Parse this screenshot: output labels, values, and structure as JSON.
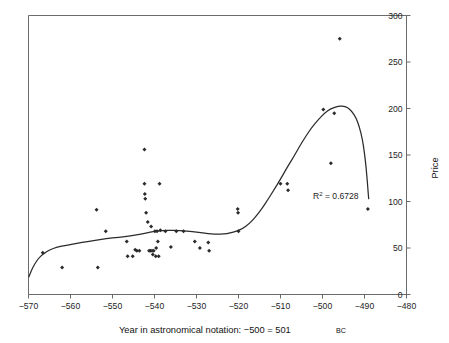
{
  "chart_data": {
    "type": "scatter",
    "title": "",
    "subtitle": "",
    "xlabel_main": "Year in astronomical notation: −500 = 501",
    "xlabel_era": "BC",
    "ylabel": "Price",
    "xlim": [
      -570,
      -480
    ],
    "ylim": [
      0,
      300
    ],
    "grid": false,
    "legend": "none",
    "xticks": [
      -570,
      -560,
      -550,
      -540,
      -530,
      -520,
      -510,
      -500,
      -490,
      -480
    ],
    "xtick_labels": [
      "−570",
      "−560",
      "−550",
      "−540",
      "−530",
      "−520",
      "−510",
      "−500",
      "−490",
      "−480"
    ],
    "yticks": [
      0,
      50,
      100,
      150,
      200,
      250,
      300
    ],
    "ytick_labels": [
      "0",
      "50",
      "100",
      "150",
      "200",
      "250",
      "300"
    ],
    "y_axis_position": "right",
    "annotations": [
      {
        "name": "r-squared",
        "text_prefix": "R",
        "text_sup": "2",
        "text_suffix": " = 0.6728",
        "x": -499.5,
        "y": 106
      }
    ],
    "series": [
      {
        "name": "Price observations",
        "marker": "diamond",
        "color": "#2a2a2a",
        "points": [
          [
            -566.6,
            45
          ],
          [
            -562.0,
            29
          ],
          [
            -553.8,
            91
          ],
          [
            -553.5,
            29
          ],
          [
            -551.6,
            68
          ],
          [
            -546.6,
            57
          ],
          [
            -546.4,
            41
          ],
          [
            -545.2,
            41
          ],
          [
            -544.6,
            48
          ],
          [
            -544.2,
            47
          ],
          [
            -543.6,
            47
          ],
          [
            -542.4,
            119
          ],
          [
            -542.4,
            156
          ],
          [
            -542.3,
            108
          ],
          [
            -542.2,
            103
          ],
          [
            -542.0,
            88
          ],
          [
            -541.6,
            78
          ],
          [
            -541.3,
            47
          ],
          [
            -541.0,
            47
          ],
          [
            -540.8,
            73
          ],
          [
            -540.6,
            47
          ],
          [
            -540.4,
            43
          ],
          [
            -540.2,
            47
          ],
          [
            -539.9,
            68
          ],
          [
            -539.7,
            41
          ],
          [
            -539.6,
            50
          ],
          [
            -539.4,
            68
          ],
          [
            -539.2,
            57
          ],
          [
            -539.0,
            41
          ],
          [
            -538.8,
            119
          ],
          [
            -538.6,
            69
          ],
          [
            -537.4,
            68
          ],
          [
            -536.1,
            51
          ],
          [
            -534.8,
            68
          ],
          [
            -533.1,
            68
          ],
          [
            -530.4,
            57
          ],
          [
            -529.2,
            50
          ],
          [
            -527.2,
            56
          ],
          [
            -527.0,
            47
          ],
          [
            -520.2,
            92
          ],
          [
            -520.1,
            88
          ],
          [
            -520.0,
            68
          ],
          [
            -510.0,
            119
          ],
          [
            -508.4,
            119
          ],
          [
            -508.2,
            112
          ],
          [
            -499.8,
            199
          ],
          [
            -498.0,
            141
          ],
          [
            -497.2,
            195
          ],
          [
            -495.9,
            275
          ],
          [
            -489.2,
            92
          ]
        ]
      }
    ],
    "trend": {
      "name": "polynomial-fit",
      "color": "#2b2b2b",
      "r_squared": 0.6728,
      "points": [
        [
          -569.9,
          19
        ],
        [
          -569.3,
          26
        ],
        [
          -568.5,
          33
        ],
        [
          -567.6,
          39
        ],
        [
          -566.4,
          44
        ],
        [
          -565.0,
          48
        ],
        [
          -563.2,
          51
        ],
        [
          -561.0,
          53
        ],
        [
          -558.5,
          55
        ],
        [
          -556.0,
          57
        ],
        [
          -553.0,
          59
        ],
        [
          -550.0,
          61
        ],
        [
          -547.0,
          62
        ],
        [
          -544.5,
          64
        ],
        [
          -542.0,
          66
        ],
        [
          -540.0,
          68
        ],
        [
          -538.0,
          69
        ],
        [
          -536.0,
          69
        ],
        [
          -534.0,
          69
        ],
        [
          -532.0,
          68
        ],
        [
          -530.0,
          67
        ],
        [
          -528.0,
          66
        ],
        [
          -526.5,
          65
        ],
        [
          -525.0,
          65
        ],
        [
          -523.5,
          65
        ],
        [
          -522.0,
          66
        ],
        [
          -520.5,
          68
        ],
        [
          -519.0,
          71
        ],
        [
          -517.5,
          76
        ],
        [
          -516.0,
          83
        ],
        [
          -514.5,
          92
        ],
        [
          -513.0,
          102
        ],
        [
          -511.5,
          113
        ],
        [
          -510.0,
          124
        ],
        [
          -508.5,
          136
        ],
        [
          -507.0,
          147
        ],
        [
          -505.5,
          159
        ],
        [
          -504.0,
          170
        ],
        [
          -502.5,
          180
        ],
        [
          -501.0,
          188
        ],
        [
          -499.5,
          195
        ],
        [
          -498.0,
          200
        ],
        [
          -496.5,
          202
        ],
        [
          -495.2,
          203
        ],
        [
          -494.0,
          201
        ],
        [
          -493.0,
          197
        ],
        [
          -492.0,
          190
        ],
        [
          -491.2,
          180
        ],
        [
          -490.5,
          167
        ],
        [
          -490.0,
          152
        ],
        [
          -489.6,
          136
        ],
        [
          -489.3,
          120
        ],
        [
          -489.1,
          108
        ],
        [
          -489.0,
          103
        ]
      ]
    }
  },
  "figure": {
    "background_color": "#ffffff",
    "frame_color": "#5a5a5a",
    "marker_color": "#2a2a2a",
    "trend_color": "#2b2b2b"
  }
}
